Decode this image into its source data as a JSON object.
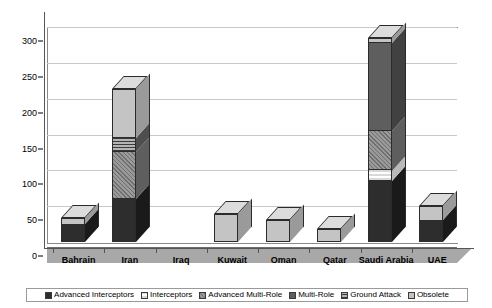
{
  "chart_data": {
    "type": "bar",
    "title": "",
    "xlabel": "",
    "ylabel": "",
    "ylim": [
      0,
      300
    ],
    "yticks": [
      0,
      50,
      100,
      150,
      200,
      250,
      300
    ],
    "grid": true,
    "stacked": true,
    "legend_position": "bottom",
    "categories": [
      "Bahrain",
      "Iran",
      "Iraq",
      "Kuwait",
      "Oman",
      "Qatar",
      "Saudi Arabia",
      "UAE"
    ],
    "series": [
      {
        "name": "Advanced Interceptors",
        "pattern": "solid-black",
        "values": [
          24,
          60,
          0,
          0,
          0,
          0,
          85,
          30
        ]
      },
      {
        "name": "Interceptors",
        "pattern": "light-hatch",
        "values": [
          0,
          0,
          0,
          0,
          0,
          0,
          15,
          0
        ]
      },
      {
        "name": "Advanced Multi-Role",
        "pattern": "diagonal-hatch",
        "values": [
          0,
          65,
          0,
          0,
          0,
          0,
          55,
          0
        ]
      },
      {
        "name": "Multi-Role",
        "pattern": "solid-gray",
        "values": [
          0,
          0,
          0,
          0,
          0,
          0,
          123,
          0
        ]
      },
      {
        "name": "Ground Attack",
        "pattern": "horiz-stripe",
        "values": [
          0,
          20,
          0,
          0,
          0,
          0,
          0,
          0
        ]
      },
      {
        "name": "Obsolete",
        "pattern": "solid-lightgray",
        "values": [
          9,
          68,
          0,
          39,
          31,
          18,
          7,
          20
        ]
      }
    ],
    "totals": [
      33,
      213,
      0,
      39,
      31,
      18,
      285,
      50
    ]
  },
  "axis": {
    "yticks": [
      {
        "label": "300",
        "value": 300
      },
      {
        "label": "250",
        "value": 250
      },
      {
        "label": "200",
        "value": 200
      },
      {
        "label": "150",
        "value": 150
      },
      {
        "label": "100",
        "value": 100
      },
      {
        "label": "50",
        "value": 50
      },
      {
        "label": "0",
        "value": 0
      }
    ]
  },
  "legend": {
    "items": [
      {
        "label": "Advanced Interceptors"
      },
      {
        "label": "Interceptors"
      },
      {
        "label": "Advanced Multi-Role"
      },
      {
        "label": "Multi-Role"
      },
      {
        "label": "Ground Attack"
      },
      {
        "label": "Obsolete"
      }
    ]
  },
  "colors": {
    "advanced_interceptors": "#2d2d2d",
    "interceptors": "#e8e8e8",
    "advanced_multi_role": "#8a8a8a",
    "multi_role": "#5e5e5e",
    "ground_attack": "#6f6f6f",
    "obsolete": "#c4c4c4",
    "floor": "#a8a8a8",
    "grid": "#c9c9c9"
  }
}
